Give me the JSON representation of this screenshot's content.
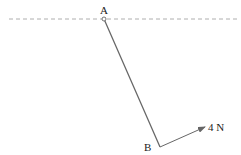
{
  "diagram": {
    "labels": {
      "point_a": "A",
      "point_b": "B",
      "force": "4 N"
    },
    "colors": {
      "line": "#555555",
      "dashed": "#999999",
      "text": "#222222"
    },
    "elements": {
      "ceiling": {
        "type": "dashed-line",
        "x1": 9,
        "y1": 19,
        "x2": 240,
        "y2": 19
      },
      "rod": {
        "type": "line",
        "from": "A",
        "to": "B"
      },
      "pivot": {
        "type": "circle",
        "at": "A"
      },
      "force_arrow": {
        "type": "arrow",
        "from": "B",
        "magnitude_label": "4 N"
      }
    }
  }
}
